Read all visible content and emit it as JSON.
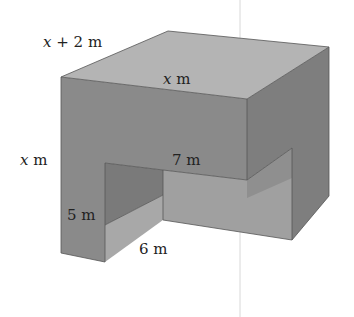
{
  "figure": {
    "type": "3d-prism-with-notch",
    "colors": {
      "top_face": "#b4b4b4",
      "front_face": "#8a8a8a",
      "right_face": "#7e7e7e",
      "notch_left_wall": "#a5a5a5",
      "notch_inner_dark": "#777777",
      "notch_floor_front": "#a2a2a2",
      "notch_back_wall": "#9c9c9c",
      "edge": "#555555",
      "background": "#ffffff"
    },
    "labels": {
      "top_back_edge": {
        "var": "x",
        "text": " + 2 m"
      },
      "top_front_edge": {
        "var": "x",
        "text": " m"
      },
      "left_height": {
        "var": "x",
        "text": " m"
      },
      "notch_width": {
        "text": "7 m"
      },
      "notch_height": {
        "text": "5 m"
      },
      "notch_depth": {
        "text": "6 m"
      }
    }
  }
}
